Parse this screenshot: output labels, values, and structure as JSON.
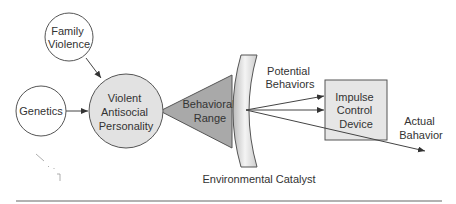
{
  "nodes": {
    "family_violence": [
      "Family",
      "Violence"
    ],
    "genetics": "Genetics",
    "personality": [
      "Violent",
      "Antisocial",
      "Personality"
    ],
    "behavioral_range": [
      "Behavioral",
      "Range"
    ],
    "impulse_control": [
      "Impulse",
      "Control",
      "Device"
    ]
  },
  "labels": {
    "potential_behaviors": [
      "Potential",
      "Behaviors"
    ],
    "actual_behavior": [
      "Actual",
      "Bahavior"
    ],
    "environmental_catalyst": "Environmental Catalyst"
  },
  "colors": {
    "circle_fill": "#ffffff",
    "personality_fill": "#e2e2e2",
    "triangle_fill": "#a9a9a9",
    "box_fill": "#e6e6e6",
    "stroke": "#555555"
  }
}
